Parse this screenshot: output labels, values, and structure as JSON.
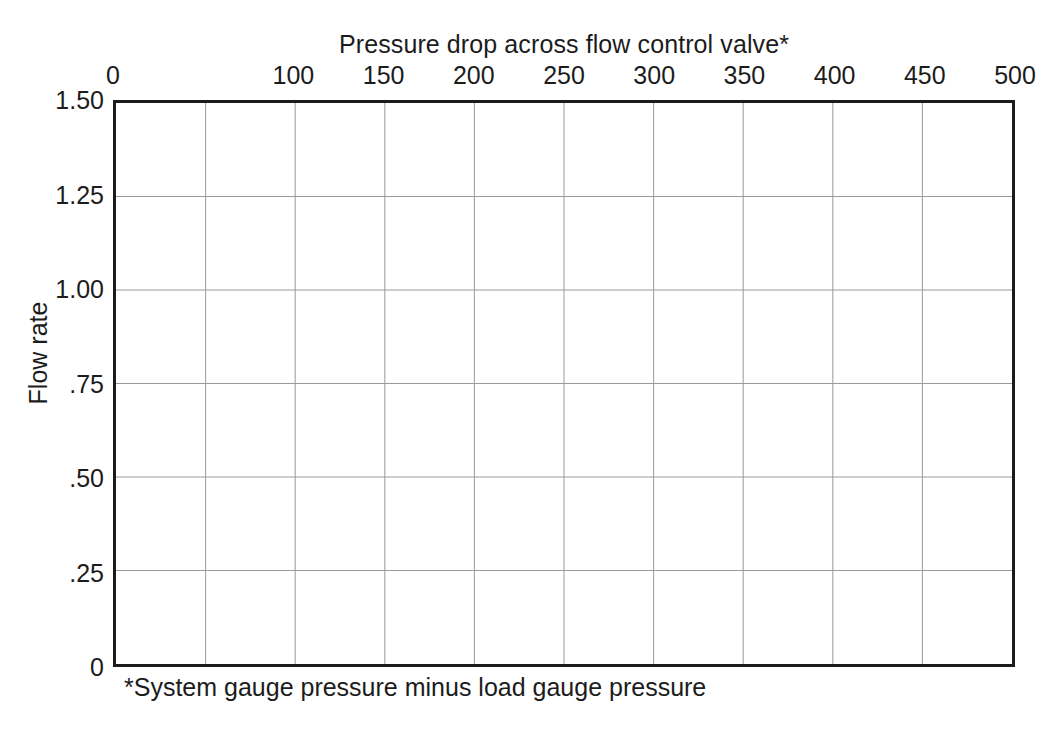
{
  "chart_data": {
    "type": "line",
    "title": "Pressure drop across flow control valve*",
    "xlabel": "Pressure drop across flow control valve*",
    "ylabel": "Flow rate",
    "footnote": "*System gauge pressure minus load gauge pressure",
    "xlim": [
      0,
      500
    ],
    "ylim": [
      0,
      1.5
    ],
    "x_axis_position": "top",
    "grid": true,
    "legend": false,
    "series": [],
    "x_ticks": [
      0,
      50,
      100,
      150,
      200,
      250,
      300,
      350,
      400,
      450,
      500
    ],
    "x_tick_labels": [
      "0",
      "",
      "100",
      "150",
      "200",
      "250",
      "300",
      "350",
      "400",
      "450",
      "500"
    ],
    "y_ticks": [
      0,
      0.25,
      0.5,
      0.75,
      1.0,
      1.25,
      1.5
    ],
    "y_tick_labels": [
      "0",
      ".25",
      ".50",
      ".75",
      "1.00",
      "1.25",
      "1.50"
    ],
    "x_gridline_count": 9,
    "y_gridline_count": 5,
    "note": "Empty plotting grid; no data series are drawn in the figure."
  },
  "style": {
    "frame_color": "#1b1b1b",
    "grid_color": "#9a9a9a",
    "text_color": "#1c1c1c",
    "background": "#ffffff"
  }
}
